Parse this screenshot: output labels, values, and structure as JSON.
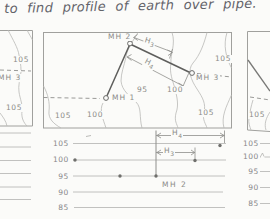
{
  "title": "to find profile of earth over pipe.",
  "plan": {
    "left_panel": {
      "contour_label_top": "105",
      "mh_label": "MH 3",
      "contour_label_bottom": "105"
    },
    "center_panel": {
      "mh1": "MH 1",
      "mh2": "MH 2",
      "mh3": "MH 3",
      "dim_h3": {
        "main": "H",
        "sub": "3"
      },
      "dim_h4": {
        "main": "H",
        "sub": "4"
      },
      "contour_95": "95",
      "contour_100_mid": "100",
      "contour_105_topright": "105",
      "contour_105_bottomleft": "105",
      "contour_100_bottomleft": "100",
      "contour_105_bottomright": "105"
    },
    "right_panel": {
      "contour_label": "105"
    }
  },
  "profile": {
    "left_axis": [
      "105",
      "100",
      "95",
      "90",
      "85"
    ],
    "right_axis": [
      "105",
      "100",
      "95",
      "90",
      "85"
    ],
    "mh2_label": "MH 2",
    "dim_h3": {
      "main": "H",
      "sub": "3"
    },
    "dim_h4": {
      "main": "H",
      "sub": "4"
    },
    "plotted_point_elevations": [
      100,
      95,
      95,
      100,
      105
    ]
  },
  "colors": {
    "background": "#fbfbf9",
    "contour_line": "#b9b9b6",
    "panel_border": "#a0a09d",
    "pipe_line": "#5e5e5c",
    "dimension_line": "#8f8f8c",
    "label_text": "#8b8b88",
    "handwriting": "#63636a"
  }
}
